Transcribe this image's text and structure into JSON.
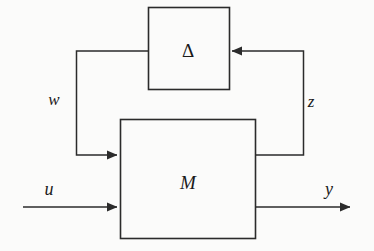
{
  "diagram": {
    "background_color": "#fbfbfa",
    "line_color": "#2b2b2b",
    "blocks": [
      {
        "id": "delta",
        "label": "Δ",
        "name": "delta-block",
        "x": 148,
        "y": 7,
        "width": 81,
        "height": 82
      },
      {
        "id": "m",
        "label": "M",
        "name": "m-block",
        "x": 120,
        "y": 119,
        "width": 135,
        "height": 119
      }
    ],
    "signals": [
      {
        "id": "w",
        "label": "w",
        "name": "signal-label-w",
        "x": 54,
        "y": 99
      },
      {
        "id": "z",
        "label": "z",
        "name": "signal-label-z",
        "x": 311,
        "y": 101
      },
      {
        "id": "u",
        "label": "u",
        "name": "signal-label-u",
        "x": 49,
        "y": 189
      },
      {
        "id": "y",
        "label": "y",
        "name": "signal-label-y",
        "x": 329,
        "y": 189
      }
    ],
    "connections": [
      {
        "id": "delta-to-w",
        "name": "delta-output-to-w-path",
        "from": "delta-left",
        "to": "m-input-w"
      },
      {
        "id": "z-to-delta",
        "name": "z-path-to-delta-input",
        "from": "m-output-z",
        "to": "delta-right"
      },
      {
        "id": "u-input",
        "name": "u-input-arrow",
        "from": "external",
        "to": "m-block"
      },
      {
        "id": "y-output",
        "name": "y-output-arrow",
        "from": "m-block",
        "to": "external"
      }
    ]
  }
}
